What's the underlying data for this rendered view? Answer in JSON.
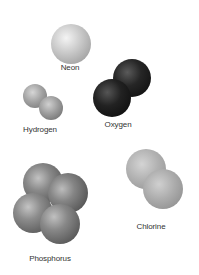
{
  "figure": {
    "background": "#ffffff",
    "molecules": [
      {
        "name": "Neon",
        "label_pos": [
          70,
          63
        ],
        "color": "light-gray",
        "atoms": [
          {
            "cx": 71,
            "cy": 44,
            "r": 20
          }
        ]
      },
      {
        "name": "Hydrogen",
        "label_pos": [
          40,
          125
        ],
        "color": "mid-gray",
        "atoms": [
          {
            "cx": 35,
            "cy": 96,
            "r": 12
          },
          {
            "cx": 51,
            "cy": 108,
            "r": 12
          }
        ]
      },
      {
        "name": "Oxygen",
        "label_pos": [
          118,
          120
        ],
        "color": "black",
        "atoms": [
          {
            "cx": 132,
            "cy": 78,
            "r": 19
          },
          {
            "cx": 112,
            "cy": 98,
            "r": 19
          }
        ]
      },
      {
        "name": "Phosphorus",
        "label_pos": [
          50,
          254
        ],
        "color": "dark-gray",
        "atoms": [
          {
            "cx": 43,
            "cy": 183,
            "r": 20
          },
          {
            "cx": 68,
            "cy": 193,
            "r": 20
          },
          {
            "cx": 33,
            "cy": 213,
            "r": 20
          },
          {
            "cx": 60,
            "cy": 224,
            "r": 20
          }
        ]
      },
      {
        "name": "Chlorine",
        "label_pos": [
          151,
          222
        ],
        "color": "light-mid-gray",
        "atoms": [
          {
            "cx": 146,
            "cy": 169,
            "r": 20
          },
          {
            "cx": 163,
            "cy": 189,
            "r": 20
          }
        ]
      }
    ]
  },
  "labels": {
    "neon": "Neon",
    "hydrogen": "Hydrogen",
    "oxygen": "Oxygen",
    "phosphorus": "Phosphorus",
    "chlorine": "Chlorine"
  },
  "colors": {
    "neon": {
      "highlight": "#f2f2f2",
      "base": "#c4c4c4",
      "shadow": "#8a8a8a"
    },
    "hydrogen": {
      "highlight": "#d8d8d8",
      "base": "#9a9a9a",
      "shadow": "#5e5e5e"
    },
    "oxygen": {
      "highlight": "#5a5a5a",
      "base": "#1e1e1e",
      "shadow": "#050505"
    },
    "phosphorus": {
      "highlight": "#c0c0c0",
      "base": "#7a7a7a",
      "shadow": "#444444"
    },
    "chlorine": {
      "highlight": "#dedede",
      "base": "#ababab",
      "shadow": "#7a7a7a"
    },
    "label_text": "#333333"
  }
}
